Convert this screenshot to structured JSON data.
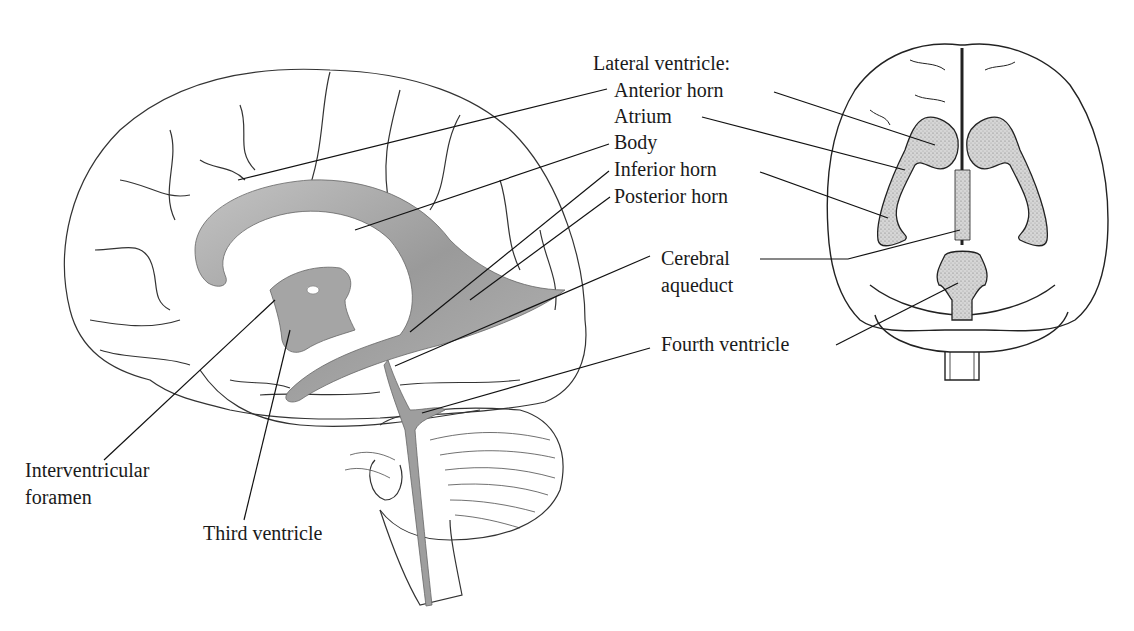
{
  "diagram": {
    "views": [
      "lateral-view",
      "dorsal-view"
    ],
    "colors": {
      "ventricle_fill": "#a8a8a8",
      "ventricle_dark": "#8a8a8a",
      "outline": "#222222",
      "stipple_fill": "#d2d2d2"
    },
    "labels": {
      "lateral_ventricle_heading": "Lateral ventricle:",
      "anterior_horn": "Anterior horn",
      "atrium": "Atrium",
      "body": "Body",
      "inferior_horn": "Inferior horn",
      "posterior_horn": "Posterior horn",
      "cerebral_aqueduct_line1": "Cerebral",
      "cerebral_aqueduct_line2": "aqueduct",
      "fourth_ventricle": "Fourth ventricle",
      "interventricular_foramen_line1": "Interventricular",
      "interventricular_foramen_line2": "foramen",
      "third_ventricle": "Third ventricle"
    }
  }
}
